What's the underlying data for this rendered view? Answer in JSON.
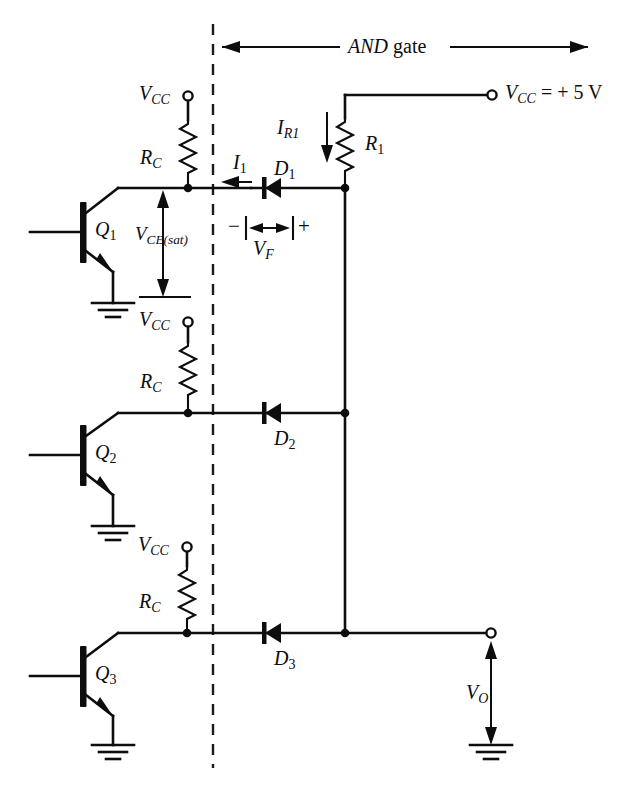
{
  "figure": {
    "type": "circuit-schematic",
    "section_label": "AND gate",
    "section_label_style": "AND italic, gate roman"
  },
  "supply": {
    "right_rail_label": "V",
    "right_rail_sub": "CC",
    "right_rail_value": "= + 5 V",
    "right_rail_full": "VCC = + 5 V"
  },
  "stages": [
    {
      "transistor": "Q",
      "transistor_sub": "1",
      "collector_resistor": "R",
      "collector_resistor_sub": "C",
      "supply_label": "V",
      "supply_sub": "CC",
      "diode": "D",
      "diode_sub": "1"
    },
    {
      "transistor": "Q",
      "transistor_sub": "2",
      "collector_resistor": "R",
      "collector_resistor_sub": "C",
      "supply_label": "V",
      "supply_sub": "CC",
      "diode": "D",
      "diode_sub": "2"
    },
    {
      "transistor": "Q",
      "transistor_sub": "3",
      "collector_resistor": "R",
      "collector_resistor_sub": "C",
      "supply_label": "V",
      "supply_sub": "CC",
      "diode": "D",
      "diode_sub": "3"
    }
  ],
  "components": {
    "pullup_resistor": "R",
    "pullup_resistor_sub": "1"
  },
  "annotations": {
    "current_i1": "I",
    "current_i1_sub": "1",
    "current_ir1": "I",
    "current_ir1_sub": "R1",
    "v_ce_sat": "V",
    "v_ce_sat_sub": "CE(sat)",
    "v_forward": "V",
    "v_forward_sub": "F",
    "polarity_minus": "−",
    "polarity_plus": "+",
    "output_voltage": "V",
    "output_voltage_sub": "O"
  },
  "colors": {
    "ink": "#0d0d0d",
    "background": "#ffffff"
  }
}
